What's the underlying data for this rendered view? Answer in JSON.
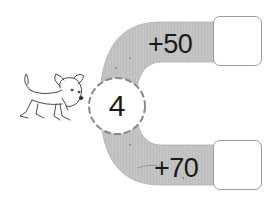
{
  "diagram": {
    "type": "arithmetic-function-machine",
    "start_value": "4",
    "branches": [
      {
        "operation": "+50",
        "answer": ""
      },
      {
        "operation": "+70",
        "answer": ""
      }
    ],
    "illustration": "dog",
    "colors": {
      "band_fill": "#c4c4c4",
      "band_edge": "#a8a8a8",
      "circle_border": "#8a8a8a",
      "box_border": "#9a9a9a",
      "text": "#1a1a1a",
      "background": "#ffffff"
    }
  }
}
